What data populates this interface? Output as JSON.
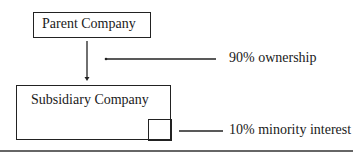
{
  "diagram": {
    "parent": {
      "label": "Parent Company"
    },
    "subsidiary": {
      "label": "Subsidiary Company"
    },
    "annotations": {
      "ownership": "90% ownership",
      "minority": "10% minority interest"
    },
    "colors": {
      "line": "#222222",
      "background": "#ffffff"
    }
  }
}
